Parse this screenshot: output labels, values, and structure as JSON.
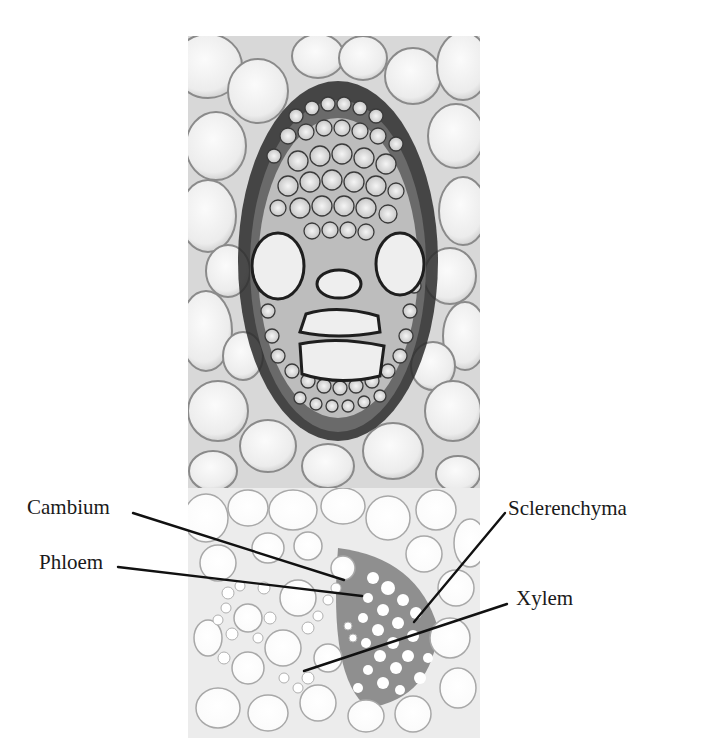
{
  "figure": {
    "top_panel": {
      "description": "Micrograph: monocot vascular bundle cross-section with sclerenchyma sheath, two large metaxylem vessels and phloem"
    },
    "bottom_panel": {
      "description": "Micrograph: dicot vascular bundle cross-section with labeled tissues"
    },
    "labels": [
      {
        "id": "cambium",
        "text": "Cambium"
      },
      {
        "id": "phloem",
        "text": "Phloem"
      },
      {
        "id": "sclerenchyma",
        "text": "Sclerenchyma"
      },
      {
        "id": "xylem",
        "text": "Xylem"
      }
    ],
    "colors": {
      "background": "#ffffff",
      "cell_wall_dark": "#2a2a2a",
      "cell_wall_light": "#9a9a9a",
      "cell_fill": "#f2f2f2",
      "xylem_matrix": "#8c8c8c",
      "leader_line": "#111111",
      "label_text": "#1a1a1a"
    }
  }
}
